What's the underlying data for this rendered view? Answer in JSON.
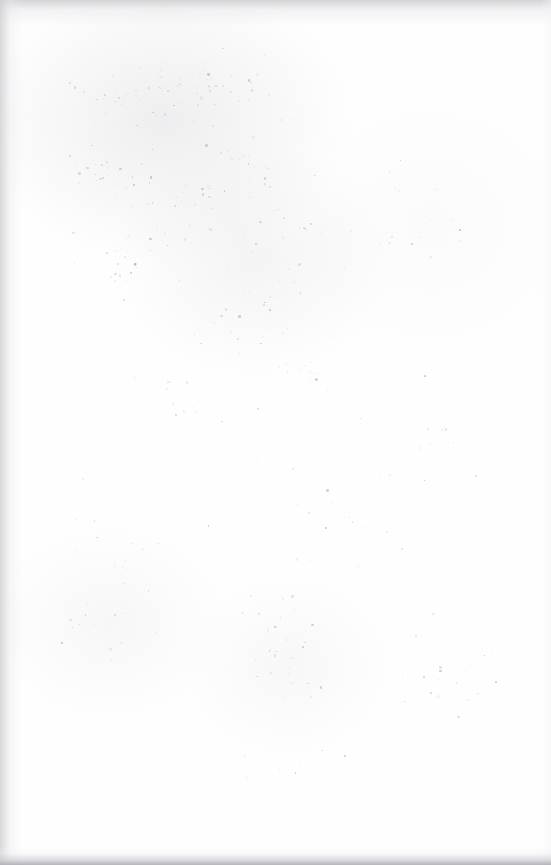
{
  "document": {
    "page_kind": "blank-scanned-page",
    "visible_text": "",
    "text_lines": [],
    "has_figures": false,
    "has_rules": false,
    "page_width": 551,
    "page_height": 865
  },
  "appearance": {
    "paper_color": "#fefefe",
    "background_color": "#ffffff",
    "speckle_color": "#9a9aa0",
    "edge_shadow_color": "#b0b0b6"
  },
  "edges": {
    "top_shadow": true,
    "left_shadow": true,
    "right_shadow": true,
    "bottom_shadow": true
  },
  "noise": {
    "seed": 20316,
    "count": 520,
    "min_size": 0.6,
    "max_size": 2.6,
    "min_opacity": 0.05,
    "max_opacity": 0.55,
    "clusters": [
      {
        "cx": 150,
        "cy": 95,
        "rx": 110,
        "ry": 55,
        "weight": 46
      },
      {
        "cx": 205,
        "cy": 80,
        "rx": 130,
        "ry": 42,
        "weight": 40
      },
      {
        "cx": 110,
        "cy": 165,
        "rx": 70,
        "ry": 60,
        "weight": 34
      },
      {
        "cx": 175,
        "cy": 215,
        "rx": 80,
        "ry": 65,
        "weight": 40
      },
      {
        "cx": 255,
        "cy": 160,
        "rx": 95,
        "ry": 70,
        "weight": 34
      },
      {
        "cx": 120,
        "cy": 265,
        "rx": 65,
        "ry": 55,
        "weight": 26
      },
      {
        "cx": 300,
        "cy": 240,
        "rx": 85,
        "ry": 60,
        "weight": 26
      },
      {
        "cx": 250,
        "cy": 310,
        "rx": 75,
        "ry": 55,
        "weight": 22
      },
      {
        "cx": 310,
        "cy": 370,
        "rx": 70,
        "ry": 55,
        "weight": 30
      },
      {
        "cx": 425,
        "cy": 215,
        "rx": 85,
        "ry": 70,
        "weight": 24
      },
      {
        "cx": 180,
        "cy": 400,
        "rx": 90,
        "ry": 70,
        "weight": 18
      },
      {
        "cx": 120,
        "cy": 560,
        "rx": 70,
        "ry": 60,
        "weight": 22
      },
      {
        "cx": 100,
        "cy": 630,
        "rx": 60,
        "ry": 55,
        "weight": 28
      },
      {
        "cx": 285,
        "cy": 665,
        "rx": 55,
        "ry": 55,
        "weight": 34
      },
      {
        "cx": 270,
        "cy": 615,
        "rx": 50,
        "ry": 40,
        "weight": 20
      },
      {
        "cx": 455,
        "cy": 690,
        "rx": 70,
        "ry": 60,
        "weight": 20
      },
      {
        "cx": 430,
        "cy": 470,
        "rx": 80,
        "ry": 70,
        "weight": 16
      },
      {
        "cx": 330,
        "cy": 520,
        "rx": 80,
        "ry": 65,
        "weight": 14
      },
      {
        "cx": 275,
        "cy": 760,
        "rx": 110,
        "ry": 45,
        "weight": 14
      },
      {
        "cx": 275,
        "cy": 432,
        "rx": 265,
        "ry": 420,
        "weight": 42
      }
    ]
  }
}
